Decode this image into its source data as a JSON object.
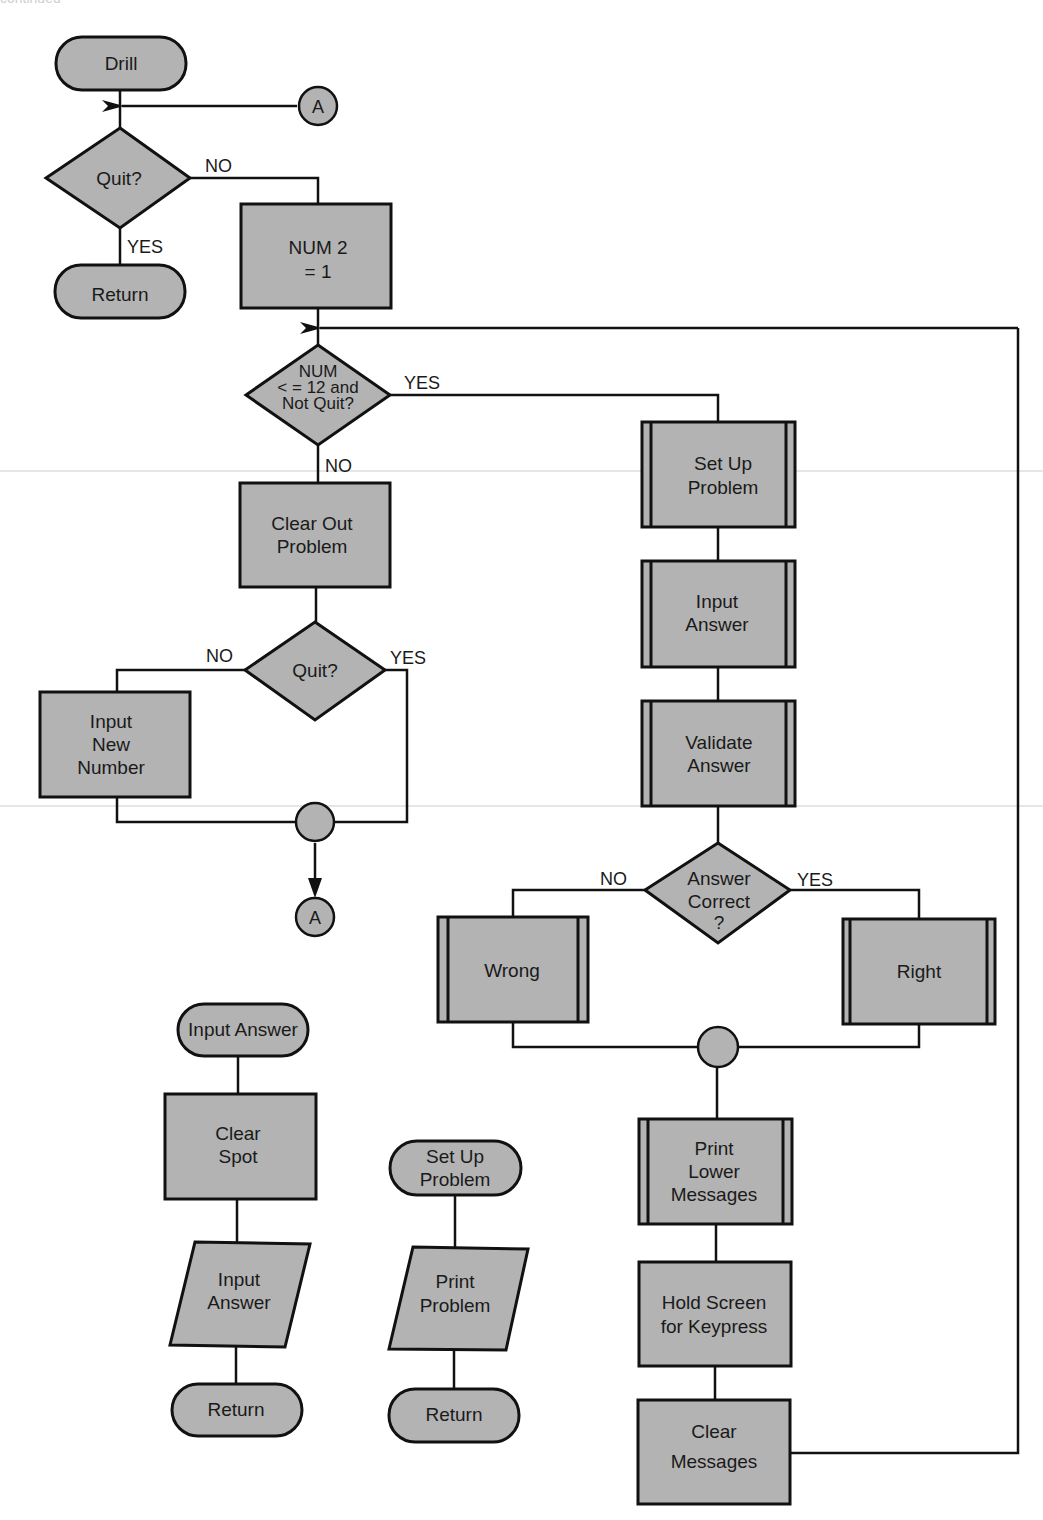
{
  "header": {
    "caption": "continued"
  },
  "colors": {
    "shape_fill": "#b3b3b3",
    "stroke": "#111111",
    "background": "#ffffff"
  },
  "main_flow": {
    "start": "Drill",
    "connector_a_top": "A",
    "quit_decision": "Quit?",
    "quit_no": "NO",
    "quit_yes": "YES",
    "return": "Return",
    "num2_line1": "NUM 2",
    "num2_line2": "= 1",
    "loop_decision_line1": "NUM",
    "loop_decision_line2": "< = 12 and",
    "loop_decision_line3": "Not Quit?",
    "loop_yes": "YES",
    "loop_no": "NO",
    "clear_out_line1": "Clear Out",
    "clear_out_line2": "Problem",
    "quit2_decision": "Quit?",
    "quit2_no": "NO",
    "quit2_yes": "YES",
    "input_new_line1": "Input",
    "input_new_line2": "New",
    "input_new_line3": "Number",
    "connector_a_bottom": "A"
  },
  "loop_body": {
    "setup_line1": "Set Up",
    "setup_line2": "Problem",
    "input_line1": "Input",
    "input_line2": "Answer",
    "validate_line1": "Validate",
    "validate_line2": "Answer",
    "correct_line1": "Answer",
    "correct_line2": "Correct",
    "correct_line3": "?",
    "correct_no": "NO",
    "correct_yes": "YES",
    "wrong": "Wrong",
    "right": "Right",
    "print_line1": "Print",
    "print_line2": "Lower",
    "print_line3": "Messages",
    "hold_line1": "Hold Screen",
    "hold_line2": "for Keypress",
    "clearmsg_line1": "Clear",
    "clearmsg_line2": "Messages"
  },
  "sub_input_answer": {
    "start": "Input Answer",
    "clear_line1": "Clear",
    "clear_line2": "Spot",
    "io_line1": "Input",
    "io_line2": "Answer",
    "return": "Return"
  },
  "sub_setup_problem": {
    "start_line1": "Set Up",
    "start_line2": "Problem",
    "io_line1": "Print",
    "io_line2": "Problem",
    "return": "Return"
  }
}
